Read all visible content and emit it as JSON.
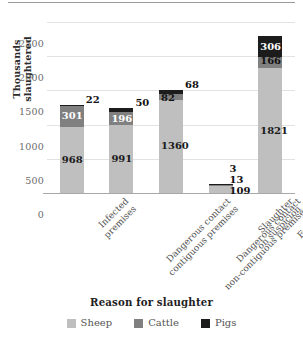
{
  "chart_data": {
    "type": "bar",
    "subtype": "stacked-column",
    "title": "",
    "xlabel": "Reason for slaughter",
    "ylabel": "Thousands slaughtered",
    "ylim": [
      0,
      2500
    ],
    "yticks": [
      0,
      500,
      1000,
      1500,
      2000,
      2500
    ],
    "ytick_labels": [
      "0",
      "500",
      "1000",
      "1500",
      "2000",
      "2500"
    ],
    "grid": true,
    "legend_position": "bottom",
    "categories": [
      "Infected premises",
      "Dangerous contact contiguous premises",
      "Dangerous contact non-contiguous premises",
      "Slaughter on suspicion",
      "For welfare reasons"
    ],
    "category_lines": [
      [
        "Infected",
        "premises"
      ],
      [
        "Dangerous contact",
        "contiguous premises"
      ],
      [
        "Dangerous contact",
        "non-contiguous premises"
      ],
      [
        "Slaughter",
        "on suspicion"
      ],
      [
        "For welfare",
        "reasons"
      ]
    ],
    "series": [
      {
        "name": "Sheep",
        "color": "#bfbfbf",
        "values": [
          968,
          991,
          1360,
          109,
          1821
        ]
      },
      {
        "name": "Cattle",
        "color": "#808080",
        "values": [
          301,
          196,
          82,
          13,
          166
        ]
      },
      {
        "name": "Pigs",
        "color": "#1c1c1c",
        "values": [
          22,
          50,
          68,
          3,
          306
        ]
      }
    ],
    "totals": [
      1291,
      1237,
      1510,
      125,
      2293
    ],
    "data_labels": {
      "sheep": [
        "968",
        "991",
        "1360",
        "109",
        "1821"
      ],
      "cattle": [
        "301",
        "196",
        "82",
        "13",
        "166"
      ],
      "pigs": [
        "22",
        "50",
        "68",
        "3",
        "306"
      ]
    }
  },
  "axes": {
    "y_title": "Thousands slaughtered",
    "x_title": "Reason for slaughter",
    "y_ticks": [
      "2500",
      "2000",
      "1500",
      "1000",
      "500",
      "0"
    ]
  },
  "legend": {
    "items": [
      {
        "label": "Sheep",
        "color": "#bfbfbf",
        "swatch": "legend-swatch-sheep"
      },
      {
        "label": "Cattle",
        "color": "#808080",
        "swatch": "legend-swatch-cattle"
      },
      {
        "label": "Pigs",
        "color": "#1c1c1c",
        "swatch": "legend-swatch-pigs"
      }
    ]
  }
}
